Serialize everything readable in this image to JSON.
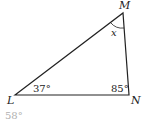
{
  "diagram": {
    "type": "triangle",
    "vertices": [
      {
        "name": "M",
        "label": "M"
      },
      {
        "name": "L",
        "label": "L"
      },
      {
        "name": "N",
        "label": "N"
      }
    ],
    "angles": {
      "L": "37°",
      "N": "85°",
      "M": "x"
    },
    "colors": {
      "lines": "#222222",
      "answer": "#b0b0b0"
    }
  },
  "answer": {
    "text": "58°"
  }
}
